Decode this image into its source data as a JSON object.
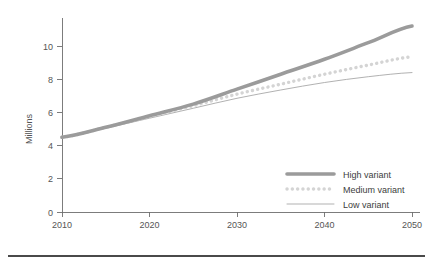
{
  "chart_data": {
    "type": "line",
    "title": "",
    "xlabel": "",
    "ylabel": "Millions",
    "xlim": [
      2010,
      2050
    ],
    "ylim": [
      0,
      11.3
    ],
    "grid": false,
    "legend_position": "bottom-right",
    "x": [
      2010,
      2015,
      2020,
      2025,
      2030,
      2035,
      2040,
      2045,
      2050
    ],
    "xticks": [
      "2010",
      "2020",
      "2030",
      "2040",
      "2050"
    ],
    "xtick_values": [
      2010,
      2020,
      2030,
      2040,
      2050
    ],
    "yticks": [
      "0",
      "2",
      "4",
      "6",
      "8",
      "10"
    ],
    "ytick_values": [
      0,
      2,
      4,
      6,
      8,
      10
    ],
    "series": [
      {
        "name": "High variant",
        "style": "thick-solid",
        "color": "#9b9b9b",
        "values": [
          4.5,
          5.1,
          5.8,
          6.5,
          7.4,
          8.3,
          9.2,
          10.2,
          11.2
        ]
      },
      {
        "name": "Medium variant",
        "style": "dotted",
        "color": "#d4d4d4",
        "values": [
          4.5,
          5.1,
          5.75,
          6.4,
          7.1,
          7.7,
          8.3,
          8.85,
          9.35
        ]
      },
      {
        "name": "Low variant",
        "style": "thin-solid",
        "color": "#a8a8a8",
        "values": [
          4.5,
          5.05,
          5.65,
          6.25,
          6.85,
          7.35,
          7.8,
          8.15,
          8.4
        ]
      }
    ]
  },
  "axis": {
    "y_title": "Millions"
  },
  "legend": {
    "items": [
      {
        "label": "High variant"
      },
      {
        "label": "Medium variant"
      },
      {
        "label": "Low variant"
      }
    ]
  },
  "colors": {
    "high": "#9b9b9b",
    "medium": "#d4d4d4",
    "low": "#a8a8a8",
    "axis": "#6e6e6e",
    "text": "#555555",
    "rule": "#4a4a4a",
    "background": "#ffffff"
  }
}
